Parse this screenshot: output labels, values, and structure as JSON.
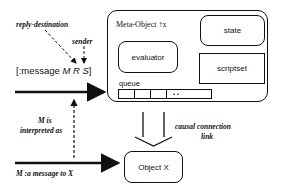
{
  "labels": {
    "reply_destination": "reply-destination",
    "sender": "sender",
    "message_prefix": "[:message ",
    "message_args": "M R S",
    "message_suffix": "]",
    "m_is": "M is",
    "interpreted_as": "interpreted as",
    "message_to_x": "M  :a message to  X",
    "causal_1": "causal connection",
    "causal_2": "link"
  },
  "meta_object": {
    "title": "Meta-Object ↑x",
    "state": "state",
    "evaluator": "evaluator",
    "scriptset": "scriptset",
    "queue_label": "queue",
    "queue_ellipsis": "• •"
  },
  "object": {
    "label": "Object X"
  }
}
